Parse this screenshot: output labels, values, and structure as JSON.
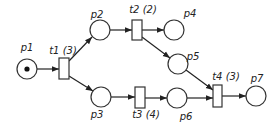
{
  "diagram": {
    "type": "petri-net",
    "places": [
      {
        "id": "p1",
        "label": "p1",
        "cx": 27,
        "cy": 69,
        "tokens": 1,
        "lx": 27,
        "ly": 51
      },
      {
        "id": "p2",
        "label": "p2",
        "cx": 100,
        "cy": 30,
        "tokens": 0,
        "lx": 97,
        "ly": 18
      },
      {
        "id": "p3",
        "label": "p3",
        "cx": 101,
        "cy": 97,
        "tokens": 0,
        "lx": 97,
        "ly": 118
      },
      {
        "id": "p4",
        "label": "p4",
        "cx": 174,
        "cy": 30,
        "tokens": 0,
        "lx": 190,
        "ly": 17
      },
      {
        "id": "p5",
        "label": "p5",
        "cx": 178,
        "cy": 64,
        "tokens": 0,
        "lx": 193,
        "ly": 60
      },
      {
        "id": "p6",
        "label": "p6",
        "cx": 177,
        "cy": 98,
        "tokens": 0,
        "lx": 186,
        "ly": 120
      },
      {
        "id": "p7",
        "label": "p7",
        "cx": 256,
        "cy": 96,
        "tokens": 0,
        "lx": 257,
        "ly": 82
      }
    ],
    "transitions": [
      {
        "id": "t1",
        "label": "t1 (3)",
        "x": 59,
        "y": 58,
        "w": 10,
        "h": 21,
        "lx": 63,
        "ly": 54
      },
      {
        "id": "t2",
        "label": "t2 (2)",
        "x": 132,
        "y": 20,
        "w": 10,
        "h": 20,
        "lx": 143,
        "ly": 13
      },
      {
        "id": "t3",
        "label": "t3 (4)",
        "x": 135,
        "y": 87,
        "w": 10,
        "h": 21,
        "lx": 146,
        "ly": 118
      },
      {
        "id": "t4",
        "label": "t4 (3)",
        "x": 213,
        "y": 85,
        "w": 9,
        "h": 22,
        "lx": 226,
        "ly": 80
      }
    ],
    "arcs": [
      {
        "from": "p1",
        "to": "t1",
        "x1": 37,
        "y1": 69,
        "x2": 59,
        "y2": 69
      },
      {
        "from": "t1",
        "to": "p2",
        "x1": 69,
        "y1": 61,
        "x2": 92,
        "y2": 37
      },
      {
        "from": "t1",
        "to": "p3",
        "x1": 69,
        "y1": 76,
        "x2": 93,
        "y2": 91
      },
      {
        "from": "p2",
        "to": "t2",
        "x1": 110,
        "y1": 30,
        "x2": 132,
        "y2": 30
      },
      {
        "from": "t2",
        "to": "p4",
        "x1": 142,
        "y1": 30,
        "x2": 164,
        "y2": 30
      },
      {
        "from": "t2",
        "to": "p5",
        "x1": 142,
        "y1": 37,
        "x2": 170,
        "y2": 58
      },
      {
        "from": "p3",
        "to": "t3",
        "x1": 111,
        "y1": 97,
        "x2": 135,
        "y2": 97
      },
      {
        "from": "t3",
        "to": "p6",
        "x1": 145,
        "y1": 98,
        "x2": 167,
        "y2": 98
      },
      {
        "from": "p5",
        "to": "t4",
        "x1": 186,
        "y1": 70,
        "x2": 213,
        "y2": 90
      },
      {
        "from": "p6",
        "to": "t4",
        "x1": 187,
        "y1": 98,
        "x2": 213,
        "y2": 98
      },
      {
        "from": "t4",
        "to": "p7",
        "x1": 222,
        "y1": 96,
        "x2": 246,
        "y2": 96
      }
    ]
  }
}
